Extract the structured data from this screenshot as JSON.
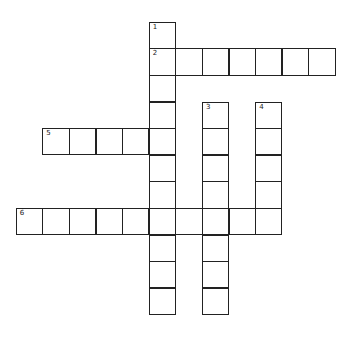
{
  "crossword": {
    "cell_size": 26.6,
    "origin": {
      "x": 16.5,
      "y": 22.5
    },
    "entries": [
      {
        "number": "1",
        "direction": "down",
        "row": 0,
        "col": 5,
        "length": 11
      },
      {
        "number": "2",
        "direction": "across",
        "row": 1,
        "col": 5,
        "length": 7
      },
      {
        "number": "3",
        "direction": "down",
        "row": 3,
        "col": 7,
        "length": 8
      },
      {
        "number": "4",
        "direction": "down",
        "row": 3,
        "col": 9,
        "length": 5
      },
      {
        "number": "5",
        "direction": "across",
        "row": 4,
        "col": 1,
        "length": 5
      },
      {
        "number": "6",
        "direction": "across",
        "row": 7,
        "col": 0,
        "length": 10
      }
    ]
  }
}
